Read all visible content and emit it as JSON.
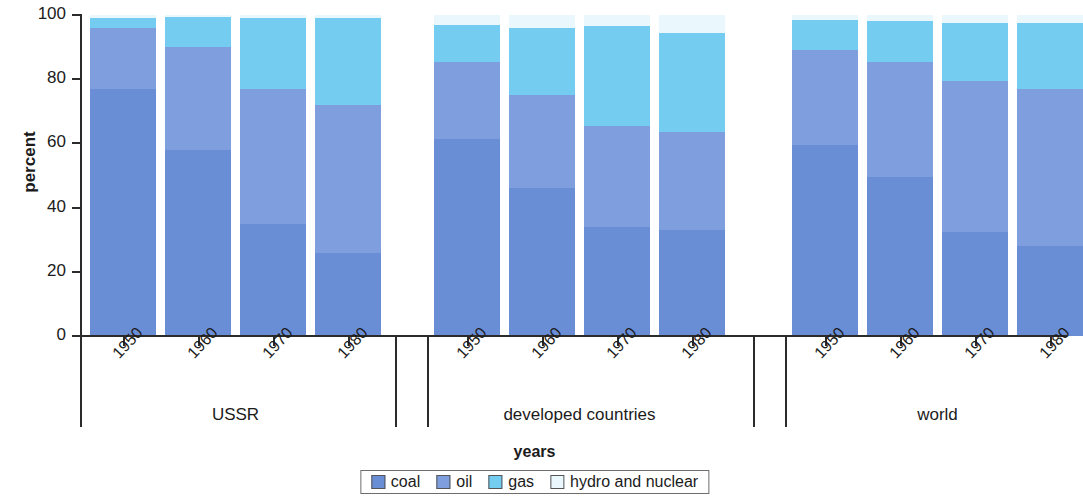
{
  "chart_data": {
    "type": "bar",
    "stacked": true,
    "stack_total": 100,
    "title": "",
    "xlabel": "years",
    "ylabel": "percent",
    "ylim": [
      0,
      100
    ],
    "yticks": [
      0,
      20,
      40,
      60,
      80,
      100
    ],
    "grid": false,
    "legend_position": "bottom",
    "series": [
      {
        "name": "coal",
        "color": "#6a8ed6"
      },
      {
        "name": "oil",
        "color": "#7f9ede"
      },
      {
        "name": "gas",
        "color": "#74cdf0"
      },
      {
        "name": "hydro and nuclear",
        "color": "#eaf7fd"
      }
    ],
    "groups": [
      {
        "name": "USSR",
        "categories": [
          "1950",
          "1960",
          "1970",
          "1980"
        ],
        "values": {
          "coal": [
            77,
            58,
            35,
            26
          ],
          "oil": [
            19,
            32,
            42,
            46
          ],
          "gas": [
            3,
            9.5,
            22,
            27
          ],
          "hydro and nuclear": [
            1,
            0.5,
            1,
            1
          ]
        }
      },
      {
        "name": "developed countries",
        "categories": [
          "1950",
          "1960",
          "1970",
          "1980"
        ],
        "values": {
          "coal": [
            61.5,
            46,
            34,
            33
          ],
          "oil": [
            24,
            29,
            31.5,
            30.5
          ],
          "gas": [
            11.5,
            21,
            31,
            31
          ],
          "hydro and nuclear": [
            3,
            4,
            3.5,
            5.5
          ]
        }
      },
      {
        "name": "world",
        "categories": [
          "1950",
          "1960",
          "1970",
          "1980"
        ],
        "values": {
          "coal": [
            59.5,
            49.5,
            32.5,
            28
          ],
          "oil": [
            29.5,
            36,
            47,
            49
          ],
          "gas": [
            9.5,
            12.5,
            18,
            20.5
          ],
          "hydro and nuclear": [
            1.5,
            2,
            2.5,
            2.5
          ]
        }
      }
    ]
  },
  "axes": {
    "y_title": "percent",
    "x_title": "years",
    "y_tick_labels": [
      "100",
      "80",
      "60",
      "40",
      "20",
      "0"
    ]
  },
  "legend": {
    "items": [
      {
        "label": "coal"
      },
      {
        "label": "oil"
      },
      {
        "label": "gas"
      },
      {
        "label": "hydro and nuclear"
      }
    ]
  }
}
